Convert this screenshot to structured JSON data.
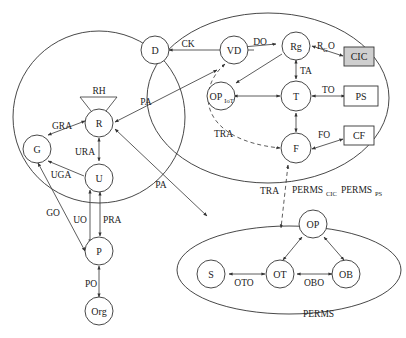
{
  "diagram": {
    "nodes": {
      "D": "D",
      "VD": "VD",
      "Rg": "Rg",
      "CIC": "CIC",
      "OP_IoT": "OP",
      "OP_IoT_sub": "IoT",
      "T": "T",
      "PS": "PS",
      "F": "F",
      "CF": "CF",
      "R": "R",
      "G": "G",
      "U": "U",
      "P": "P",
      "Org": "Org",
      "OP": "OP",
      "S": "S",
      "OT": "OT",
      "OB": "OB"
    },
    "edges": {
      "CK": "CK",
      "DO": "DO",
      "RGO_main": "R",
      "RGO_sub": "G",
      "RGO_tail": "O",
      "TA": "TA",
      "TO": "TO",
      "FO": "FO",
      "TRA_upper": "TRA",
      "TRA_lower": "TRA",
      "PA_upper": "PA",
      "PA_lower": "PA",
      "RH": "RH",
      "GRA": "GRA",
      "URA": "URA",
      "UGA": "UGA",
      "GO": "GO",
      "UO": "UO",
      "PRA": "PRA",
      "PO": "PO",
      "OTO": "OTO",
      "OBO": "OBO"
    },
    "labels": {
      "perms_cic_main": "PERMS",
      "perms_cic_sub": "CIC",
      "perms_ps_main": "PERMS",
      "perms_ps_sub": "PS",
      "perms": "PERMS"
    },
    "colors": {
      "cic_fill": "#cfcfcf"
    }
  }
}
